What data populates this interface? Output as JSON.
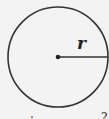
{
  "diagram": {
    "shape": "circle",
    "radius_label": "r",
    "center": {
      "x": 58,
      "y": 57
    },
    "radius_px": 50,
    "stroke_color": "#333333",
    "background": "#f3f3f3"
  },
  "cut_text": {
    "left_fragment": "·",
    "right_fragment": "?"
  }
}
